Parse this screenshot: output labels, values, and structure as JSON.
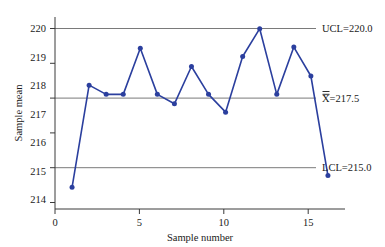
{
  "chart_data": {
    "type": "line",
    "title": "",
    "xlabel": "Sample number",
    "ylabel": "Sample mean",
    "x": [
      1,
      2,
      3,
      4,
      5,
      6,
      7,
      8,
      9,
      10,
      11,
      12,
      13,
      14,
      15,
      16
    ],
    "values": [
      214.33,
      218.0,
      217.67,
      217.67,
      219.33,
      217.67,
      217.33,
      218.67,
      217.67,
      217.03,
      219.03,
      220.03,
      217.67,
      219.37,
      218.33,
      214.75
    ],
    "series": [
      {
        "name": "Sample mean",
        "values": [
          214.33,
          218.0,
          217.67,
          217.67,
          219.33,
          217.67,
          217.33,
          218.67,
          217.67,
          217.03,
          219.03,
          220.03,
          217.67,
          219.37,
          218.33,
          214.75
        ]
      }
    ],
    "xlim": [
      0,
      17
    ],
    "ylim": [
      213.55,
      220.45
    ],
    "xticks": [
      0,
      5,
      10,
      15
    ],
    "xtick_labels": [
      "0",
      "5",
      "10",
      "15"
    ],
    "yticks": [
      214,
      215,
      216,
      217,
      218,
      219,
      220
    ],
    "ytick_labels": [
      "214",
      "215",
      "216",
      "217",
      "218",
      "219",
      "220"
    ],
    "grid": false,
    "legend": "none",
    "marker": "circle",
    "line_color": "#2b3f9e",
    "marker_color": "#2b3f9e",
    "limit_line_color": "#7a7a7a",
    "control_limits": [
      {
        "key": "ucl",
        "value": 220.0,
        "label": "UCL=220.0"
      },
      {
        "key": "center",
        "value": 217.5,
        "label": "X=217.5",
        "label_prefix": "X",
        "label_suffix": "=217.5",
        "has_double_overbar": true
      },
      {
        "key": "lcl",
        "value": 215.0,
        "label": "LCL=215.0"
      }
    ]
  }
}
